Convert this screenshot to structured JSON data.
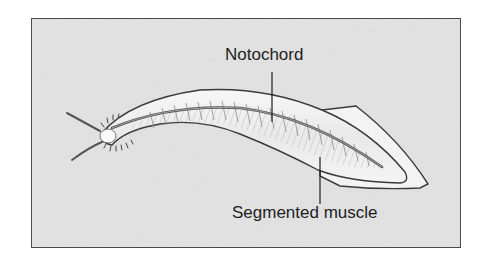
{
  "diagram": {
    "labels": [
      {
        "id": "notochord",
        "text": "Notochord"
      },
      {
        "id": "segmented_muscle",
        "text": "Segmented muscle"
      }
    ],
    "colors": {
      "background_panel": "#e4e4e4",
      "frame_border": "#4a4a4a",
      "body_outline": "#3a3a3a",
      "body_fill": "#f2f2f2",
      "notochord": "#555555",
      "leader_line": "#1e1e1e",
      "text": "#1e1e1e"
    }
  }
}
